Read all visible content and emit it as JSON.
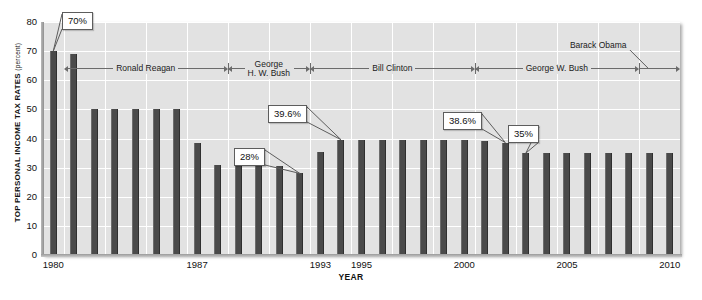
{
  "chart_data": {
    "type": "bar",
    "title": "",
    "xlabel": "YEAR",
    "ylabel": "TOP PERSONAL INCOME TAX RATES",
    "ylabel_unit": "(percent)",
    "ylim": [
      0,
      80
    ],
    "ytick_values": [
      0,
      10,
      20,
      30,
      40,
      50,
      60,
      70,
      80
    ],
    "ytick_labels": [
      "0",
      "10",
      "20",
      "30",
      "40",
      "50",
      "60",
      "70",
      "80"
    ],
    "xtick_labels": [
      "1980",
      "1987",
      "1993",
      "1995",
      "2000",
      "2005",
      "2010"
    ],
    "xtick_years": [
      1980,
      1987,
      1993,
      1995,
      2000,
      2005,
      2010
    ],
    "grid": true,
    "bar_color": "#4a4a4a",
    "plot_background": "#e2e2e2",
    "gridline_color": "#ffffff",
    "categories": [
      1980,
      1981,
      1982,
      1983,
      1984,
      1985,
      1986,
      1987,
      1988,
      1989,
      1990,
      1991,
      1992,
      1993,
      1994,
      1995,
      1996,
      1997,
      1998,
      1999,
      2000,
      2001,
      2002,
      2003,
      2004,
      2005,
      2006,
      2007,
      2008,
      2009,
      2010
    ],
    "values": [
      70,
      69.1,
      50,
      50,
      50,
      50,
      50,
      38.5,
      31,
      31,
      31,
      30.6,
      28,
      35.5,
      39.6,
      39.6,
      39.6,
      39.6,
      39.6,
      39.6,
      39.6,
      39.1,
      38.6,
      35,
      35,
      35,
      35,
      35,
      35,
      35,
      35
    ],
    "annotations": [
      {
        "label": "70%",
        "year": 1980,
        "value": 70
      },
      {
        "label": "28%",
        "year": 1992,
        "value": 28
      },
      {
        "label": "39.6%",
        "year": 1994,
        "value": 39.6
      },
      {
        "label": "38.6%",
        "year": 2002,
        "value": 38.6
      },
      {
        "label": "35%",
        "year": 2003,
        "value": 35
      }
    ],
    "timeline": {
      "label": "presidential-terms",
      "segments": [
        {
          "name": "Ronald Reagan",
          "start_year": 1981,
          "end_year": 1988
        },
        {
          "name": "George\nH. W. Bush",
          "start_year": 1989,
          "end_year": 1992
        },
        {
          "name": "Bill Clinton",
          "start_year": 1993,
          "end_year": 2000
        },
        {
          "name": "George W. Bush",
          "start_year": 2001,
          "end_year": 2008
        },
        {
          "name": "Barack Obama",
          "start_year": 2009,
          "end_year": 2010
        }
      ]
    }
  },
  "labels": {
    "reagan": "Ronald Reagan",
    "hwbush_line1": "George",
    "hwbush_line2": "H. W. Bush",
    "clinton": "Bill Clinton",
    "gwbush": "George W. Bush",
    "obama": "Barack Obama",
    "ylabel_main": "TOP PERSONAL INCOME TAX RATES",
    "ylabel_unit": "(percent)",
    "xlabel": "YEAR"
  },
  "callouts": {
    "c70": "70%",
    "c28": "28%",
    "c396": "39.6%",
    "c386": "38.6%",
    "c35": "35%"
  },
  "yticks": [
    "80",
    "70",
    "60",
    "50",
    "40",
    "30",
    "20",
    "10",
    "0"
  ],
  "xticks": [
    "1980",
    "1987",
    "1993",
    "1995",
    "2000",
    "2005",
    "2010"
  ]
}
